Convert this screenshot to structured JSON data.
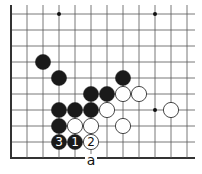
{
  "diagram": {
    "type": "go-board-fragment",
    "grid": {
      "columns": 12,
      "rows": 10,
      "origin_x": 11,
      "origin_y": 14,
      "spacing": 16,
      "left_edge": true,
      "bottom_edge": true,
      "top_edge": false,
      "right_edge": false,
      "line_color": "#555555",
      "edge_color": "#333333"
    },
    "star_points": [
      {
        "col": 3,
        "row": 0
      },
      {
        "col": 9,
        "row": 0
      },
      {
        "col": 9,
        "row": 6
      }
    ],
    "stones": [
      {
        "color": "black",
        "col": 2,
        "row": 3,
        "label": ""
      },
      {
        "color": "black",
        "col": 3,
        "row": 4,
        "label": ""
      },
      {
        "color": "black",
        "col": 7,
        "row": 4,
        "label": ""
      },
      {
        "color": "black",
        "col": 5,
        "row": 5,
        "label": ""
      },
      {
        "color": "black",
        "col": 6,
        "row": 5,
        "label": ""
      },
      {
        "color": "white",
        "col": 7,
        "row": 5,
        "label": ""
      },
      {
        "color": "white",
        "col": 8,
        "row": 5,
        "label": ""
      },
      {
        "color": "black",
        "col": 3,
        "row": 6,
        "label": ""
      },
      {
        "color": "black",
        "col": 4,
        "row": 6,
        "label": ""
      },
      {
        "color": "black",
        "col": 5,
        "row": 6,
        "label": ""
      },
      {
        "color": "white",
        "col": 6,
        "row": 6,
        "label": ""
      },
      {
        "color": "white",
        "col": 10,
        "row": 6,
        "label": ""
      },
      {
        "color": "black",
        "col": 3,
        "row": 7,
        "label": ""
      },
      {
        "color": "white",
        "col": 4,
        "row": 7,
        "label": ""
      },
      {
        "color": "white",
        "col": 5,
        "row": 7,
        "label": ""
      },
      {
        "color": "white",
        "col": 7,
        "row": 7,
        "label": ""
      },
      {
        "color": "black",
        "col": 3,
        "row": 8,
        "label": "3"
      },
      {
        "color": "black",
        "col": 4,
        "row": 8,
        "label": "1"
      },
      {
        "color": "white",
        "col": 5,
        "row": 8,
        "label": "2"
      }
    ],
    "point_labels": [
      {
        "col": 5,
        "row": 9,
        "text": "a"
      }
    ],
    "colors": {
      "black_stone": "#1a1a1a",
      "white_stone": "#ffffff",
      "white_stone_outline": "#333333",
      "background": "#ffffff"
    }
  }
}
